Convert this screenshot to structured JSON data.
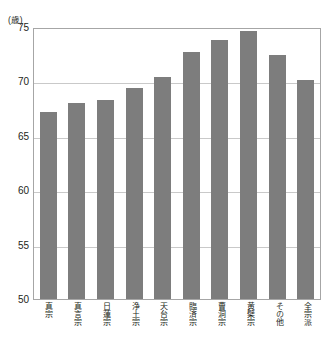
{
  "figure": {
    "clipped_header": "",
    "unit_label": "(歳)",
    "footnote": ""
  },
  "chart_data": {
    "type": "bar",
    "title": "",
    "xlabel": "",
    "ylabel": "(歳)",
    "ylim": [
      50,
      75
    ],
    "yticks": [
      50,
      55,
      60,
      65,
      70,
      75
    ],
    "ytick_labels": [
      "50",
      "55",
      "60",
      "65",
      "70",
      "75"
    ],
    "grid": true,
    "legend": "none",
    "bar_color": "#7d7d7d",
    "categories": [
      "真宗",
      "真言宗",
      "日蓮宗",
      "浄土宗",
      "天台宗",
      "臨済宗",
      "曹洞宗",
      "黄檗宗",
      "その他",
      "全宗派"
    ],
    "values": [
      67.2,
      68.0,
      68.3,
      69.4,
      70.4,
      72.7,
      73.8,
      74.6,
      72.4,
      70.1
    ]
  }
}
